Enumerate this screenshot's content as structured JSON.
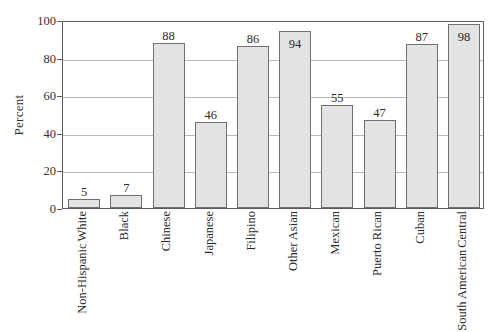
{
  "chart_data": {
    "type": "bar",
    "title": "",
    "xlabel": "",
    "ylabel": "Percent",
    "ylim": [
      0,
      100
    ],
    "yticks": [
      0,
      20,
      40,
      60,
      80,
      100
    ],
    "ytick_labels": [
      "0",
      "20",
      "40",
      "60",
      "80",
      "100"
    ],
    "grid": "horizontal",
    "legend": "none",
    "categories": [
      "White Non-Hispanic",
      "Black",
      "Chinese",
      "Japanese",
      "Filipino",
      "Other Asian",
      "Mexican",
      "Puerto Rican",
      "Cuban",
      "Central South American"
    ],
    "category_lines": [
      [
        "White",
        "Non-Hispanic"
      ],
      [
        "Black"
      ],
      [
        "Chinese"
      ],
      [
        "Japanese"
      ],
      [
        "Filipino"
      ],
      [
        "Other Asian"
      ],
      [
        "Mexican"
      ],
      [
        "Puerto Rican"
      ],
      [
        "Cuban"
      ],
      [
        "Central",
        "South American"
      ]
    ],
    "values": [
      5,
      7,
      88,
      46,
      86,
      94,
      55,
      47,
      87,
      98
    ],
    "value_labels": [
      "5",
      "7",
      "88",
      "46",
      "86",
      "94",
      "55",
      "47",
      "87",
      "98"
    ],
    "colors": {
      "bar_fill": "#e3e3e3",
      "bar_stroke": "#6f6f6f",
      "axis": "#5c5c5c",
      "gridline": "#b9b9b9",
      "text": "#2b2b2b",
      "background": "#ffffff"
    }
  }
}
